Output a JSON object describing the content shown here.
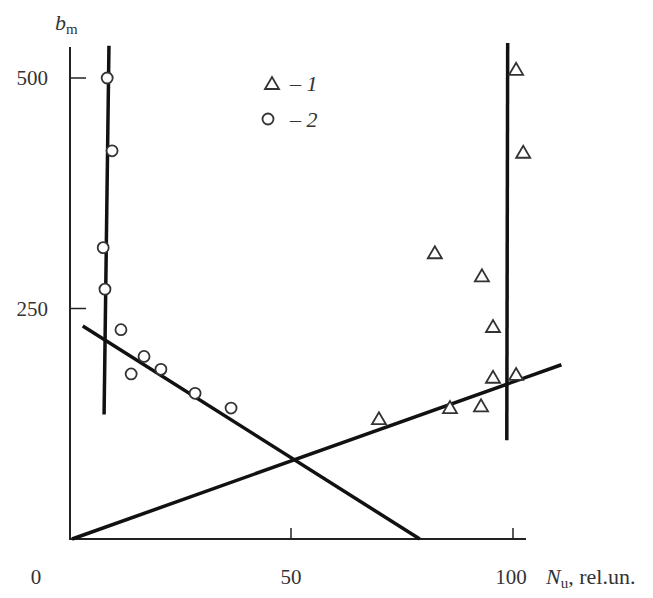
{
  "chart_data": {
    "type": "scatter",
    "title": "",
    "xlabel": "N_u, rel.un.",
    "xlabel_main": "N",
    "xlabel_sub": "u",
    "xlabel_suffix": ", rel.un.",
    "ylabel": "b_m",
    "ylabel_main": "b",
    "ylabel_sub": "m",
    "xlim": [
      0,
      112
    ],
    "ylim": [
      0,
      550
    ],
    "x_ticks": [
      0,
      50,
      100
    ],
    "x_tick_labels": [
      "0",
      "50",
      "100"
    ],
    "y_ticks": [
      250,
      500
    ],
    "y_tick_labels": [
      "250",
      "500"
    ],
    "grid": false,
    "legend_position": "upper-center",
    "legend": [
      {
        "marker": "triangle",
        "label": "– 1"
      },
      {
        "marker": "circle",
        "label": "– 2"
      }
    ],
    "series": [
      {
        "name": "1",
        "marker": "triangle",
        "points": [
          {
            "x": 100.7,
            "y": 510
          },
          {
            "x": 102.3,
            "y": 420
          },
          {
            "x": 82.4,
            "y": 311
          },
          {
            "x": 93.0,
            "y": 286
          },
          {
            "x": 95.5,
            "y": 231
          },
          {
            "x": 95.5,
            "y": 176
          },
          {
            "x": 100.7,
            "y": 179
          },
          {
            "x": 85.8,
            "y": 143
          },
          {
            "x": 92.8,
            "y": 145
          },
          {
            "x": 69.8,
            "y": 131
          }
        ]
      },
      {
        "name": "2",
        "marker": "circle",
        "points": [
          {
            "x": 8.6,
            "y": 500
          },
          {
            "x": 9.7,
            "y": 421
          },
          {
            "x": 7.7,
            "y": 316
          },
          {
            "x": 8.1,
            "y": 271
          },
          {
            "x": 11.7,
            "y": 227
          },
          {
            "x": 16.9,
            "y": 198
          },
          {
            "x": 14.0,
            "y": 179
          },
          {
            "x": 20.7,
            "y": 184
          },
          {
            "x": 28.4,
            "y": 158
          },
          {
            "x": 36.5,
            "y": 142
          }
        ]
      }
    ],
    "fit_lines": [
      {
        "name": "series-2-vertical",
        "x1": 9.0,
        "y1": 535,
        "x2": 7.9,
        "y2": 135
      },
      {
        "name": "series-1-vertical",
        "x1": 98.8,
        "y1": 538,
        "x2": 98.6,
        "y2": 107
      },
      {
        "name": "series-2-descending",
        "x1": 3.1,
        "y1": 231,
        "x2": 79.0,
        "y2": 0
      },
      {
        "name": "series-1-rising",
        "x1": 0.7,
        "y1": 0,
        "x2": 110.9,
        "y2": 189
      }
    ]
  }
}
